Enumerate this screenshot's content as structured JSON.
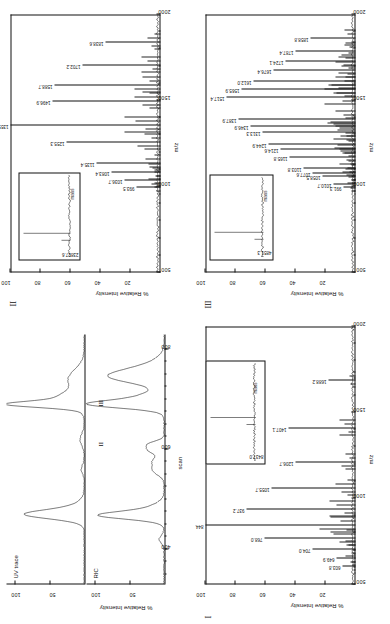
{
  "figure": {
    "panels": [
      "chromatogram",
      "I",
      "II",
      "III"
    ],
    "axis_titles": {
      "mz": "m/z",
      "scan": "scan",
      "mass": "mass",
      "relative_intensity": "% Relative Intensity"
    },
    "intensity_ticks": [
      "100",
      "80",
      "60",
      "40",
      "20"
    ],
    "chrom_intensity_ticks": [
      "100",
      "50"
    ]
  },
  "chromatogram": {
    "name": "LC-MS chromatogram",
    "traces": [
      {
        "label": "UV trace",
        "y_ticks": [
          "100",
          "50"
        ]
      },
      {
        "label": "RIC",
        "y_ticks": [
          "100",
          "50"
        ]
      }
    ],
    "xlabel": "scan",
    "ylabel": "% Relative Intensity",
    "x_ticks": [
      "400",
      "600",
      "800"
    ],
    "fraction_markers": [
      "II",
      "III"
    ]
  },
  "panel_I": {
    "id": "I",
    "xlabel": "m/z",
    "ylabel": "% Relative Intensity",
    "x_ticks": [
      "500",
      "1000",
      "1500",
      "2000"
    ],
    "y_ticks": [
      "100",
      "80",
      "60",
      "40",
      "20"
    ],
    "peaks": [
      {
        "mz": "603.8",
        "label": "603.8",
        "intensity": 9
      },
      {
        "mz": "649.9",
        "label": "649.9",
        "intensity": 13
      },
      {
        "mz": "704.0",
        "label": "704.0",
        "intensity": 29
      },
      {
        "mz": "768.0",
        "label": "768.0",
        "intensity": 61
      },
      {
        "mz": "844.3",
        "label": "844.3",
        "intensity": 100
      },
      {
        "mz": "937.2",
        "label": "937.2",
        "intensity": 73
      },
      {
        "mz": "1055.7",
        "label": "1055.7",
        "intensity": 56
      },
      {
        "mz": "1206.7",
        "label": "1206.7",
        "intensity": 40
      },
      {
        "mz": "1407.1",
        "label": "1407.1",
        "intensity": 45
      },
      {
        "mz": "1688.2",
        "label": "1688.2",
        "intensity": 18
      }
    ],
    "inset": {
      "label": "8437.0",
      "xlabel": "mass"
    }
  },
  "panel_II": {
    "id": "II",
    "xlabel": "m/z",
    "ylabel": "% Relative Intensity",
    "x_ticks": [
      "500",
      "1000",
      "1500",
      "2000"
    ],
    "y_ticks": [
      "100",
      "80",
      "60",
      "40",
      "20"
    ],
    "peaks": [
      {
        "mz": "993.5",
        "label": "993.5",
        "intensity": 16
      },
      {
        "mz": "1036.7",
        "label": "1036.7",
        "intensity": 24
      },
      {
        "mz": "1083.4",
        "label": "1083.4",
        "intensity": 33
      },
      {
        "mz": "1135.4",
        "label": "1135.4",
        "intensity": 43
      },
      {
        "mz": "1255.3",
        "label": "1255.3",
        "intensity": 63
      },
      {
        "mz": "1355.0",
        "label": "1355.0",
        "intensity": 100
      },
      {
        "mz": "1496.9",
        "label": "1496.9",
        "intensity": 72
      },
      {
        "mz": "1588.7",
        "label": "1588.7",
        "intensity": 71
      },
      {
        "mz": "1702.2",
        "label": "1702.2",
        "intensity": 52
      },
      {
        "mz": "1838.6",
        "label": "1838.6",
        "intensity": 37
      }
    ],
    "inset": {
      "label": "23827.6",
      "xlabel": "mass"
    }
  },
  "panel_III": {
    "id": "III",
    "xlabel": "m/z",
    "ylabel": "% Relative Intensity",
    "x_ticks": [
      "500",
      "1000",
      "1500",
      "2000"
    ],
    "y_ticks": [
      "100",
      "80",
      "60",
      "40",
      "20"
    ],
    "peaks": [
      {
        "mz": "991.3",
        "label": "991.3",
        "intensity": 8
      },
      {
        "mz": "1010.7",
        "label": "1010.7",
        "intensity": 15
      },
      {
        "mz": "1058.5",
        "label": "1058.5",
        "intensity": 22
      },
      {
        "mz": "1077.6",
        "label": "1077.6",
        "intensity": 29
      },
      {
        "mz": "1103.8",
        "label": "1103.8",
        "intensity": 35
      },
      {
        "mz": "1165.8",
        "label": "1165.8",
        "intensity": 44
      },
      {
        "mz": "1214.6",
        "label": "1214.6",
        "intensity": 50
      },
      {
        "mz": "1244.9",
        "label": "1244.9",
        "intensity": 58
      },
      {
        "mz": "1313.3",
        "label": "1313.3",
        "intensity": 62
      },
      {
        "mz": "1346.9",
        "label": "1346.9",
        "intensity": 70
      },
      {
        "mz": "1387.9",
        "label": "1387.9",
        "intensity": 78
      },
      {
        "mz": "1517.4",
        "label": "1517.4",
        "intensity": 86
      },
      {
        "mz": "1565.9",
        "label": "1565.9",
        "intensity": 76
      },
      {
        "mz": "1612.0",
        "label": "1612.0",
        "intensity": 68
      },
      {
        "mz": "1676.4",
        "label": "1676.4",
        "intensity": 55
      },
      {
        "mz": "1724.1",
        "label": "1724.1",
        "intensity": 47
      },
      {
        "mz": "1787.4",
        "label": "1787.4",
        "intensity": 40
      },
      {
        "mz": "1858.8",
        "label": "1858.8",
        "intensity": 30
      }
    ],
    "inset": {
      "label": "4851.3",
      "xlabel": "mass"
    }
  },
  "chart_data": {
    "type": "line",
    "charts": [
      {
        "type": "line",
        "name": "chromatogram",
        "xlabel": "scan",
        "ylabel": "% Relative Intensity",
        "xlim": [
          330,
          830
        ],
        "ylim": [
          0,
          100
        ],
        "series": [
          {
            "name": "UV trace",
            "peaks_at_scan": [
              470,
              690,
              740
            ]
          },
          {
            "name": "RIC",
            "peaks_at_scan": [
              470,
              560,
              600,
              690,
              745
            ]
          }
        ],
        "annotations": [
          "II",
          "III"
        ],
        "x_ticks": [
          400,
          600,
          800
        ],
        "y_ticks": [
          50,
          100
        ]
      },
      {
        "type": "bar",
        "name": "panel I mass spectrum",
        "xlabel": "m/z",
        "ylabel": "% Relative Intensity",
        "xlim": [
          500,
          2000
        ],
        "ylim": [
          0,
          100
        ],
        "categories": [
          603.8,
          649.9,
          704.0,
          768.0,
          844.3,
          937.2,
          1055.7,
          1206.7,
          1407.1,
          1688.2
        ],
        "values": [
          9,
          13,
          29,
          61,
          100,
          73,
          56,
          40,
          45,
          18
        ],
        "inset": {
          "xlabel": "mass",
          "peak": 8437.0
        }
      },
      {
        "type": "bar",
        "name": "panel II mass spectrum",
        "xlabel": "m/z",
        "ylabel": "% Relative Intensity",
        "xlim": [
          500,
          2000
        ],
        "ylim": [
          0,
          100
        ],
        "categories": [
          993.5,
          1036.7,
          1083.4,
          1135.4,
          1255.3,
          1355.0,
          1496.9,
          1588.7,
          1702.2,
          1838.6
        ],
        "values": [
          16,
          24,
          33,
          43,
          63,
          100,
          72,
          71,
          52,
          37
        ],
        "inset": {
          "xlabel": "mass",
          "peak": 23827.6
        }
      },
      {
        "type": "bar",
        "name": "panel III mass spectrum",
        "xlabel": "m/z",
        "ylabel": "% Relative Intensity",
        "xlim": [
          500,
          2000
        ],
        "ylim": [
          0,
          100
        ],
        "categories": [
          991.3,
          1010.7,
          1058.5,
          1077.6,
          1103.8,
          1165.8,
          1214.6,
          1244.9,
          1313.3,
          1346.9,
          1387.9,
          1517.4,
          1565.9,
          1612.0,
          1676.4,
          1724.1,
          1787.4,
          1858.8
        ],
        "values": [
          8,
          15,
          22,
          29,
          35,
          44,
          50,
          58,
          62,
          70,
          78,
          86,
          76,
          68,
          55,
          47,
          40,
          30
        ],
        "inset": {
          "xlabel": "mass",
          "peak": 4851.3
        }
      }
    ]
  }
}
